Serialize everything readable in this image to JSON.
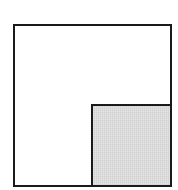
{
  "diagram": {
    "type": "geometric-figure",
    "outer_square": {
      "x": 14,
      "y": 25,
      "size": 157,
      "fill": "#ffffff",
      "stroke": "#1a1a1a",
      "stroke_width": 2
    },
    "inner_square": {
      "x": 92,
      "y": 105,
      "size": 79,
      "fill": "#d9d9d9",
      "stroke": "#1a1a1a",
      "stroke_width": 2,
      "position": "bottom-right"
    },
    "colors": {
      "background": "#ffffff",
      "line": "#1a1a1a",
      "shade": "#d9d9d9"
    }
  }
}
